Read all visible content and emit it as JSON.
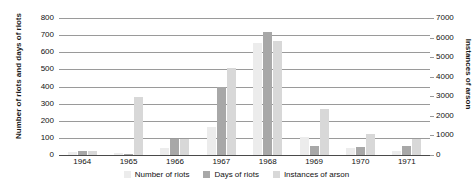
{
  "chart_data": {
    "type": "bar",
    "title": "",
    "xlabel": "",
    "ylabel": "Number of riots and days of riots",
    "ylabel_right": "Instances of arson",
    "categories": [
      "1964",
      "1965",
      "1966",
      "1967",
      "1968",
      "1969",
      "1970",
      "1971"
    ],
    "series": [
      {
        "name": "Number of riots",
        "axis": "left",
        "color": "#ececec",
        "values": [
          16,
          9,
          43,
          163,
          657,
          105,
          41,
          26
        ]
      },
      {
        "name": "Days of riots",
        "axis": "left",
        "color": "#a8a8a8",
        "values": [
          26,
          5,
          92,
          398,
          718,
          51,
          45,
          50
        ]
      },
      {
        "name": "Instances of arson",
        "axis": "right",
        "color": "#d8d8d8",
        "values": [
          180,
          2950,
          820,
          4430,
          5850,
          2340,
          1050,
          800
        ]
      }
    ],
    "ylim": [
      0,
      800
    ],
    "ylim_right": [
      0,
      7000
    ],
    "yticks": [
      "0",
      "100",
      "200",
      "300",
      "400",
      "500",
      "600",
      "700",
      "800"
    ],
    "yticks_right": [
      "0",
      "1000",
      "2000",
      "3000",
      "4000",
      "5000",
      "6000",
      "7000"
    ],
    "grid": true,
    "legend_position": "bottom"
  }
}
